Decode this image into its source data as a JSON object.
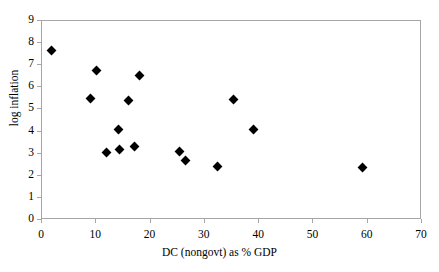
{
  "chart_data": {
    "type": "scatter",
    "title": "",
    "xlabel": "DC (nongovt) as % GDP",
    "ylabel": "log inflation",
    "xlim": [
      0,
      70
    ],
    "ylim": [
      0,
      9
    ],
    "xticks": [
      "0",
      "10",
      "20",
      "30",
      "40",
      "50",
      "60",
      "70"
    ],
    "yticks": [
      "0",
      "1",
      "2",
      "3",
      "4",
      "5",
      "6",
      "7",
      "8",
      "9"
    ],
    "grid": false,
    "legend": "none",
    "marker": "diamond",
    "marker_color": "#000000",
    "axis_color": "#a6a6a6",
    "series": [
      {
        "name": "observations",
        "points": [
          {
            "x": 1.8,
            "y": 7.65
          },
          {
            "x": 9.0,
            "y": 5.48
          },
          {
            "x": 10.0,
            "y": 6.77
          },
          {
            "x": 11.9,
            "y": 3.05
          },
          {
            "x": 14.0,
            "y": 4.08
          },
          {
            "x": 14.2,
            "y": 3.21
          },
          {
            "x": 16.0,
            "y": 5.42
          },
          {
            "x": 17.0,
            "y": 3.31
          },
          {
            "x": 18.0,
            "y": 6.55
          },
          {
            "x": 25.4,
            "y": 3.12
          },
          {
            "x": 26.4,
            "y": 2.68
          },
          {
            "x": 32.3,
            "y": 2.43
          },
          {
            "x": 35.2,
            "y": 5.46
          },
          {
            "x": 39.0,
            "y": 4.1
          },
          {
            "x": 59.0,
            "y": 2.38
          }
        ]
      }
    ]
  }
}
